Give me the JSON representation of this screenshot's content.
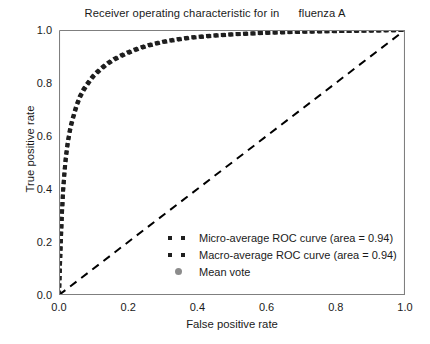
{
  "chart_data": {
    "type": "line",
    "title": "Receiver operating characteristic for in      fluenza A",
    "title_part_1": "Receiver operating characteristic for in",
    "title_part_2": "fluenza A",
    "xlabel": "False positive rate",
    "ylabel": "True positive rate",
    "xlim": [
      0.0,
      1.0
    ],
    "ylim": [
      0.0,
      1.0
    ],
    "xticks": [
      "0.0",
      "0.2",
      "0.4",
      "0.6",
      "0.8",
      "1.0"
    ],
    "xtick_values": [
      0.0,
      0.2,
      0.4,
      0.6,
      0.8,
      1.0
    ],
    "yticks": [
      "0.0",
      "0.2",
      "0.4",
      "0.6",
      "0.8",
      "1.0"
    ],
    "ytick_values": [
      0.0,
      0.2,
      0.4,
      0.6,
      0.8,
      1.0
    ],
    "grid": false,
    "legend_position": "lower right",
    "legend_frame": false,
    "series": [
      {
        "name": "Micro-average ROC curve (area = 0.94)",
        "auc": 0.94,
        "style": "dotted",
        "color": "#1f1f1f",
        "linewidth": 4,
        "x": [
          0.0,
          0.004,
          0.008,
          0.012,
          0.016,
          0.02,
          0.025,
          0.03,
          0.035,
          0.04,
          0.05,
          0.06,
          0.07,
          0.08,
          0.09,
          0.1,
          0.12,
          0.14,
          0.16,
          0.18,
          0.2,
          0.23,
          0.26,
          0.3,
          0.34,
          0.38,
          0.42,
          0.46,
          0.5,
          0.55,
          0.6,
          0.65,
          0.7,
          0.75,
          0.8,
          0.85,
          0.9,
          0.95,
          1.0
        ],
        "y": [
          0.0,
          0.16,
          0.3,
          0.4,
          0.47,
          0.525,
          0.575,
          0.615,
          0.645,
          0.67,
          0.715,
          0.75,
          0.775,
          0.795,
          0.813,
          0.83,
          0.855,
          0.875,
          0.892,
          0.905,
          0.917,
          0.932,
          0.944,
          0.956,
          0.965,
          0.972,
          0.977,
          0.981,
          0.984,
          0.987,
          0.99,
          0.992,
          0.994,
          0.995,
          0.996,
          0.997,
          0.998,
          0.999,
          1.0
        ]
      },
      {
        "name": "Macro-average ROC curve (area = 0.94)",
        "auc": 0.94,
        "style": "dotted",
        "color": "#1f1f1f",
        "linewidth": 4,
        "x": [
          0.0,
          0.004,
          0.008,
          0.012,
          0.016,
          0.02,
          0.025,
          0.03,
          0.035,
          0.04,
          0.05,
          0.06,
          0.07,
          0.08,
          0.09,
          0.1,
          0.12,
          0.14,
          0.16,
          0.18,
          0.2,
          0.23,
          0.26,
          0.3,
          0.34,
          0.38,
          0.42,
          0.46,
          0.5,
          0.55,
          0.6,
          0.65,
          0.7,
          0.75,
          0.8,
          0.85,
          0.9,
          0.95,
          1.0
        ],
        "y": [
          0.0,
          0.155,
          0.292,
          0.393,
          0.463,
          0.518,
          0.568,
          0.608,
          0.638,
          0.663,
          0.708,
          0.744,
          0.769,
          0.79,
          0.808,
          0.825,
          0.85,
          0.871,
          0.888,
          0.901,
          0.913,
          0.929,
          0.941,
          0.954,
          0.963,
          0.97,
          0.975,
          0.979,
          0.983,
          0.986,
          0.989,
          0.991,
          0.993,
          0.9945,
          0.9955,
          0.9965,
          0.9975,
          0.9988,
          1.0
        ]
      },
      {
        "name": "Mean vote",
        "style": "marker",
        "marker": "circle",
        "color": "#8c8c8c",
        "x": [],
        "y": []
      },
      {
        "name": "chance-diagonal",
        "style": "dashed",
        "color": "#000000",
        "linewidth": 2,
        "x": [
          0.0,
          1.0
        ],
        "y": [
          0.0,
          1.0
        ],
        "in_legend": false
      }
    ]
  },
  "legend": {
    "items": [
      {
        "label": "Micro-average ROC curve (area = 0.94)",
        "marker": "dotted-line",
        "color": "#1f1f1f"
      },
      {
        "label": "Macro-average ROC curve (area = 0.94)",
        "marker": "dotted-line",
        "color": "#1f1f1f"
      },
      {
        "label": "Mean vote",
        "marker": "circle-dot",
        "color": "#8c8c8c"
      }
    ]
  }
}
